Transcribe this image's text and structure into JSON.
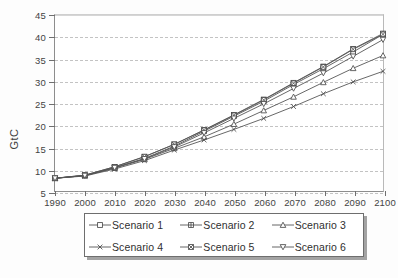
{
  "chart_data": {
    "type": "line",
    "title": "",
    "xlabel": "",
    "ylabel": "GtC",
    "xlim": [
      1990,
      2100
    ],
    "ylim": [
      5,
      45
    ],
    "ytick_step": 5,
    "grid": true,
    "legend_position": "bottom",
    "x": [
      1990,
      2000,
      2010,
      2020,
      2030,
      2040,
      2050,
      2060,
      2070,
      2080,
      2090,
      2100
    ],
    "xticklabels": [
      "1990",
      "2000",
      "2010",
      "2020",
      "2030",
      "2040",
      "2050",
      "2060",
      "2070",
      "2080",
      "2090",
      "2100"
    ],
    "yticklabels": [
      "5",
      "10",
      "15",
      "20",
      "25",
      "30",
      "35",
      "40",
      "45"
    ],
    "yticks": [
      5,
      10,
      15,
      20,
      25,
      30,
      35,
      40,
      45
    ],
    "series": [
      {
        "name": "Scenario 1",
        "marker": "open-square",
        "values": [
          7.9,
          8.5,
          10.3,
          12.4,
          15.2,
          18.6,
          22.0,
          25.4,
          29.2,
          32.8,
          36.6,
          40.6
        ]
      },
      {
        "name": "Scenario 2",
        "marker": "square-plus",
        "values": [
          7.9,
          8.6,
          10.5,
          12.8,
          15.6,
          18.9,
          22.3,
          25.8,
          29.6,
          33.3,
          37.3,
          40.8
        ]
      },
      {
        "name": "Scenario 3",
        "marker": "open-triangle-up",
        "values": [
          7.9,
          8.5,
          10.2,
          12.2,
          14.7,
          17.3,
          20.2,
          23.3,
          26.4,
          29.7,
          32.9,
          35.8
        ]
      },
      {
        "name": "Scenario 4",
        "marker": "cross-x",
        "values": [
          7.9,
          8.4,
          10.0,
          11.9,
          14.3,
          16.6,
          19.0,
          21.5,
          24.2,
          27.1,
          29.8,
          32.2
        ]
      },
      {
        "name": "Scenario 5",
        "marker": "filled-square",
        "values": [
          7.9,
          8.6,
          10.5,
          12.8,
          15.6,
          18.8,
          22.2,
          25.7,
          29.5,
          33.2,
          37.2,
          40.6
        ]
      },
      {
        "name": "Scenario 6",
        "marker": "open-triangle-down",
        "values": [
          7.9,
          8.5,
          10.3,
          12.3,
          15.0,
          18.2,
          21.5,
          24.8,
          28.3,
          31.8,
          35.6,
          39.4
        ]
      }
    ],
    "legend_entries": [
      "Scenario 1",
      "Scenario 2",
      "Scenario 3",
      "Scenario 4",
      "Scenario 5",
      "Scenario 6"
    ]
  },
  "colors": {
    "line": "#555555",
    "grid": "#c3c3c3",
    "axis": "#6f6f6f",
    "text": "#3a3a3a",
    "background": "#ffffff"
  }
}
